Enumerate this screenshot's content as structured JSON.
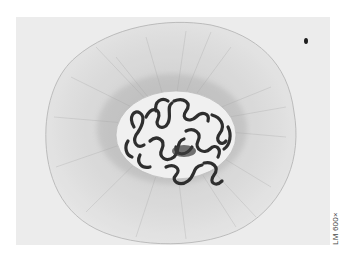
{
  "figure": {
    "scale_label": "LM 600×",
    "colors": {
      "background": "#ededed",
      "cytoplasm": "#d9d9d9",
      "nucleus": "#f2f2f2",
      "chromosomes": "#2e2e2e",
      "page": "#ffffff"
    }
  }
}
